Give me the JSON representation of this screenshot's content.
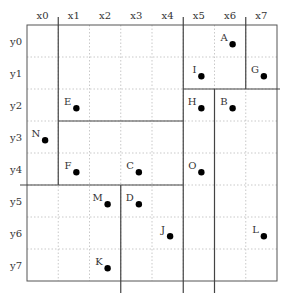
{
  "diagram": {
    "type": "grid-partition",
    "columns": [
      "x0",
      "x1",
      "x2",
      "x3",
      "x4",
      "x5",
      "x6",
      "x7"
    ],
    "rows": [
      "y0",
      "y1",
      "y2",
      "y3",
      "y4",
      "y5",
      "y6",
      "y7"
    ],
    "points": [
      {
        "label": "A",
        "col": 6,
        "row": 0
      },
      {
        "label": "B",
        "col": 6,
        "row": 2
      },
      {
        "label": "C",
        "col": 3,
        "row": 4
      },
      {
        "label": "D",
        "col": 3,
        "row": 5
      },
      {
        "label": "E",
        "col": 1,
        "row": 2
      },
      {
        "label": "F",
        "col": 1,
        "row": 4
      },
      {
        "label": "G",
        "col": 7,
        "row": 1
      },
      {
        "label": "H",
        "col": 5,
        "row": 2
      },
      {
        "label": "I",
        "col": 5,
        "row": 1
      },
      {
        "label": "J",
        "col": 4,
        "row": 6
      },
      {
        "label": "K",
        "col": 2,
        "row": 7
      },
      {
        "label": "L",
        "col": 7,
        "row": 6
      },
      {
        "label": "M",
        "col": 2,
        "row": 5
      },
      {
        "label": "N",
        "col": 0,
        "row": 3
      },
      {
        "label": "O",
        "col": 5,
        "row": 4
      }
    ],
    "partition_lines": [
      {
        "orientation": "vertical",
        "at_col_boundary": 1,
        "from_row": 0,
        "to_row": 5
      },
      {
        "orientation": "vertical",
        "at_col_boundary": 5,
        "from_row": 0,
        "to_row": 8
      },
      {
        "orientation": "vertical",
        "at_col_boundary": 7,
        "from_row": 0,
        "to_row": 2
      },
      {
        "orientation": "horizontal",
        "at_row_boundary": 2,
        "from_col": 5,
        "to_col": 8
      },
      {
        "orientation": "horizontal",
        "at_row_boundary": 3,
        "from_col": 1,
        "to_col": 5
      },
      {
        "orientation": "vertical",
        "at_col_boundary": 6,
        "from_row": 2,
        "to_row": 8
      },
      {
        "orientation": "horizontal",
        "at_row_boundary": 5,
        "from_col": 0,
        "to_col": 5
      },
      {
        "orientation": "vertical",
        "at_col_boundary": 3,
        "from_row": 5,
        "to_row": 8
      }
    ]
  }
}
